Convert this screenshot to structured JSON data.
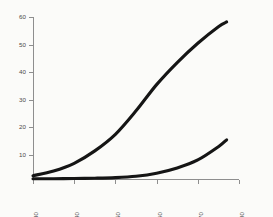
{
  "chart_data": {
    "type": "line",
    "title": "",
    "subtitle": "",
    "xlabel": "",
    "ylabel": "",
    "xlim": [
      1930,
      1980
    ],
    "ylim": [
      0,
      60
    ],
    "xticks": [
      1930,
      1940,
      1950,
      1960,
      1970,
      1980
    ],
    "xticklabels": [
      "1930",
      "1940",
      "1950",
      "1960",
      "1970",
      "1980"
    ],
    "yticks": [
      10,
      20,
      30,
      40,
      50,
      60
    ],
    "yticklabels": [
      "10",
      "20",
      "30",
      "40",
      "50",
      "60"
    ],
    "xtick_label_rotation": 90,
    "grid": false,
    "legend": false,
    "legend_position": "none",
    "line_color": "#151515",
    "axis_color": "#8e8e8e",
    "background_color": "#fbfbf9",
    "x": [
      1930,
      1935,
      1940,
      1945,
      1950,
      1955,
      1960,
      1965,
      1970,
      1975,
      1977
    ],
    "series": [
      {
        "name": "upper-curve",
        "values": [
          2.5,
          4.2,
          7.0,
          11.5,
          17.5,
          26.0,
          35.5,
          43.5,
          50.5,
          56.5,
          58.2
        ]
      },
      {
        "name": "lower-curve",
        "values": [
          1.4,
          1.4,
          1.5,
          1.6,
          1.8,
          2.3,
          3.4,
          5.3,
          8.2,
          13.0,
          15.5
        ]
      }
    ],
    "annotations": []
  },
  "figure": {
    "plot_left_px": 33,
    "plot_right_px": 239,
    "plot_top_px": 17,
    "plot_bottom_px": 179
  }
}
